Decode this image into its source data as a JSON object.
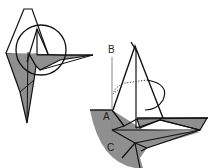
{
  "diagram": {
    "type": "origami-folding-step",
    "colors": {
      "paper_colored": "#8f8f8f",
      "paper_white": "#ffffff",
      "line": "#111111",
      "reference_line": "#888888"
    },
    "left_figure": {
      "description": "Overview of model with detail circle",
      "has_detail_circle": true
    },
    "right_figure": {
      "description": "Enlarged detail view",
      "labels": [
        {
          "id": "B",
          "text": "B"
        },
        {
          "id": "A",
          "text": "A"
        },
        {
          "id": "C",
          "text": "C"
        }
      ],
      "arrows": [
        "fold-arrow-curved"
      ],
      "has_dotted_hidden_lines": true
    }
  }
}
